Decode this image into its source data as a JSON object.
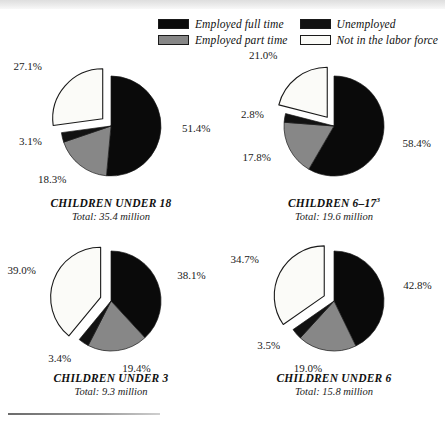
{
  "legend": {
    "items": [
      {
        "label": "Employed full time",
        "key": "fulltime",
        "color": "#0a0a0a"
      },
      {
        "label": "Unemployed",
        "key": "unemployed",
        "color": "#121212"
      },
      {
        "label": "Employed part time",
        "key": "parttime",
        "color": "#878787"
      },
      {
        "label": "Not in the labor force",
        "key": "notinlf",
        "color": "#fbfbf8"
      }
    ]
  },
  "footnote_rule": true,
  "chart_data": [
    {
      "type": "pie",
      "title": "CHILDREN UNDER 18",
      "title_footnote": "",
      "subtitle": "Total:  35.4 million",
      "total": "35.4 million",
      "exploded_slice": "Not in the labor force",
      "categories": [
        "Employed full time",
        "Employed part time",
        "Unemployed",
        "Not in the labor force"
      ],
      "values": [
        51.4,
        18.3,
        3.1,
        27.1
      ],
      "labels": [
        "51.4%",
        "18.3%",
        "3.1%",
        "27.1%"
      ],
      "colors": [
        "#0a0a0a",
        "#878787",
        "#121212",
        "#fbfbf8"
      ]
    },
    {
      "type": "pie",
      "title": "CHILDREN 6–17",
      "title_footnote": "3",
      "subtitle": "Total:  19.6 million",
      "total": "19.6 million",
      "exploded_slice": "Not in the labor force",
      "categories": [
        "Employed full time",
        "Employed part time",
        "Unemployed",
        "Not in the labor force"
      ],
      "values": [
        58.4,
        17.8,
        2.8,
        21.0
      ],
      "labels": [
        "58.4%",
        "17.8%",
        "2.8%",
        "21.0%"
      ],
      "colors": [
        "#0a0a0a",
        "#878787",
        "#121212",
        "#fbfbf8"
      ]
    },
    {
      "type": "pie",
      "title": "CHILDREN UNDER 3",
      "title_footnote": "",
      "subtitle": "Total:  9.3 million",
      "total": "9.3 million",
      "exploded_slice": "Not in the labor force",
      "categories": [
        "Employed full time",
        "Employed part time",
        "Unemployed",
        "Not in the labor force"
      ],
      "values": [
        38.1,
        19.4,
        3.4,
        39.0
      ],
      "labels": [
        "38.1%",
        "19.4%",
        "3.4%",
        "39.0%"
      ],
      "colors": [
        "#0a0a0a",
        "#878787",
        "#121212",
        "#fbfbf8"
      ]
    },
    {
      "type": "pie",
      "title": "CHILDREN UNDER 6",
      "title_footnote": "",
      "subtitle": "Total:  15.8 million",
      "total": "15.8 million",
      "exploded_slice": "Not in the labor force",
      "categories": [
        "Employed full time",
        "Employed part time",
        "Unemployed",
        "Not in the labor force"
      ],
      "values": [
        42.8,
        19.0,
        3.5,
        34.7
      ],
      "labels": [
        "42.8%",
        "19.0%",
        "3.5%",
        "34.7%"
      ],
      "colors": [
        "#0a0a0a",
        "#878787",
        "#121212",
        "#fbfbf8"
      ]
    }
  ]
}
